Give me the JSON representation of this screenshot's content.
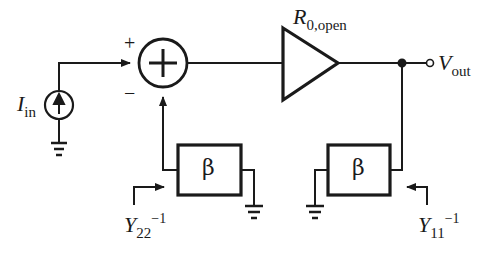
{
  "diagram": {
    "type": "feedback-block-diagram",
    "colors": {
      "stroke": "#1a1a1a",
      "background": "#ffffff"
    },
    "source": {
      "symbol": "I",
      "subscript": "in",
      "icon": "current-source-icon"
    },
    "summer": {
      "plus_sign": "+",
      "minus_sign": "−",
      "icon": "summing-junction-icon"
    },
    "amplifier": {
      "symbol": "R",
      "subscript": "0,open",
      "icon": "amplifier-triangle-icon"
    },
    "output": {
      "symbol": "V",
      "subscript": "out"
    },
    "feedback_left": {
      "label": "β",
      "port_symbol": "Y",
      "port_subscript": "22",
      "port_superscript": "−1"
    },
    "feedback_right": {
      "label": "β",
      "port_symbol": "Y",
      "port_subscript": "11",
      "port_superscript": "−1"
    }
  }
}
